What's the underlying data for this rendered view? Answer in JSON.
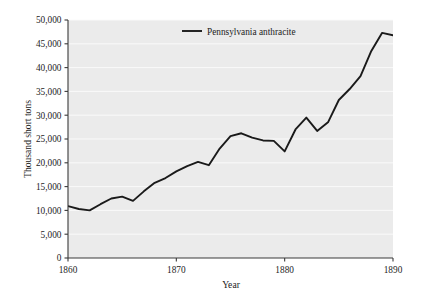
{
  "chart_data": {
    "type": "line",
    "title": "",
    "subtitle": "",
    "xlabel": "Year",
    "ylabel": "Thousand short tons",
    "xlim": [
      1860,
      1890
    ],
    "ylim": [
      0,
      50000
    ],
    "grid": true,
    "grid_orientation": "horizontal",
    "legend_position": "top-center",
    "xticks": [
      1860,
      1870,
      1880,
      1890
    ],
    "xtick_labels": [
      "1860",
      "1870",
      "1880",
      "1890"
    ],
    "yticks": [
      0,
      5000,
      10000,
      15000,
      20000,
      25000,
      30000,
      35000,
      40000,
      45000,
      50000
    ],
    "ytick_labels": [
      "0",
      "5,000",
      "10,000",
      "15,000",
      "20,000",
      "25,000",
      "30,000",
      "35,000",
      "40,000",
      "45,000",
      "50,000"
    ],
    "series": [
      {
        "name": "Pennsylvania anthracite",
        "color": "#1a1a1a",
        "x": [
          1860,
          1861,
          1862,
          1863,
          1864,
          1865,
          1866,
          1867,
          1868,
          1869,
          1870,
          1871,
          1872,
          1873,
          1874,
          1875,
          1876,
          1877,
          1878,
          1879,
          1880,
          1881,
          1882,
          1883,
          1884,
          1885,
          1886,
          1887,
          1888,
          1889,
          1890
        ],
        "values": [
          10900,
          10300,
          10000,
          11300,
          12500,
          12900,
          12000,
          14000,
          15800,
          16800,
          18200,
          19300,
          20200,
          19500,
          23000,
          25600,
          26200,
          25300,
          24700,
          24600,
          22400,
          27000,
          29500,
          26700,
          28500,
          33200,
          35500,
          38200,
          43500,
          47300,
          46800
        ]
      }
    ]
  },
  "legend": {
    "entries": [
      {
        "label": "Pennsylvania anthracite"
      }
    ]
  },
  "axes": {
    "x_title": "Year",
    "y_title": "Thousand short tons"
  }
}
